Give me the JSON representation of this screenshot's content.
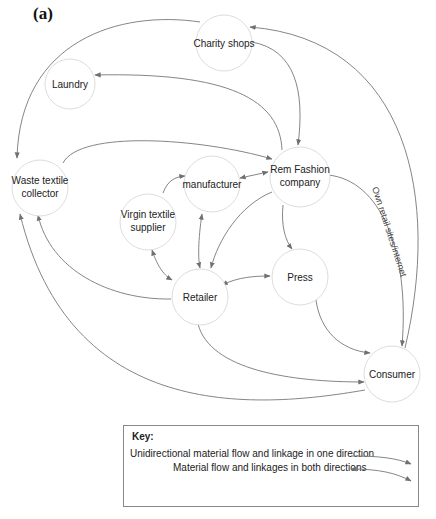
{
  "panel_label": "(a)",
  "nodes": {
    "charity_shops": "Charity shops",
    "laundry": "Laundry",
    "waste_collector_l1": "Waste textile",
    "waste_collector_l2": "collector",
    "manufacturer": "manufacturer",
    "rem_fashion_l1": "Rem Fashion",
    "rem_fashion_l2": "company",
    "virgin_supplier_l1": "Virgin textile",
    "virgin_supplier_l2": "supplier",
    "retailer": "Retailer",
    "press": "Press",
    "consumer": "Consumer"
  },
  "edge_labels": {
    "own_retail": "Own retail sites/internet"
  },
  "key": {
    "title": "Key:",
    "unidirectional": "Unidirectional material flow and linkage in one direction",
    "bidirectional": "Material flow and linkages in both directions"
  },
  "colors": {
    "node_stroke": "#dddddd",
    "edge_stroke": "#777777",
    "arrow_fill": "#6f6f6f"
  }
}
